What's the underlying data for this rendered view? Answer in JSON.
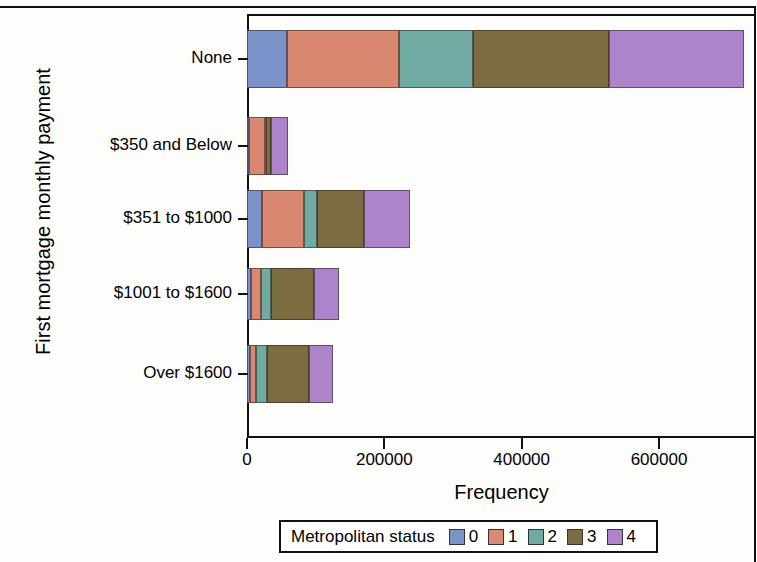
{
  "chart_data": {
    "type": "bar",
    "orientation": "horizontal",
    "stacked": true,
    "title": "",
    "xlabel": "Frequency",
    "ylabel": "First mortgage monthly payment",
    "xlim": [
      0,
      740000
    ],
    "xticks": [
      0,
      200000,
      400000,
      600000
    ],
    "xticklabels": [
      "0",
      "200000",
      "400000",
      "600000"
    ],
    "grid": false,
    "legend": {
      "title": "Metropolitan status",
      "position": "bottom",
      "entries": [
        {
          "label": "0",
          "color": "#7b93c8"
        },
        {
          "label": "1",
          "color": "#d98872"
        },
        {
          "label": "2",
          "color": "#6faaa3"
        },
        {
          "label": "3",
          "color": "#7b6c42"
        },
        {
          "label": "4",
          "color": "#ad84cb"
        }
      ]
    },
    "categories": [
      "None",
      "$350 and Below",
      "$351 to $1000",
      "$1001 to $1600",
      "Over $1600"
    ],
    "series": [
      {
        "name": "0",
        "color": "#7b93c8",
        "values": [
          58000,
          3000,
          22000,
          6000,
          4000
        ]
      },
      {
        "name": "1",
        "color": "#d98872",
        "values": [
          163000,
          23000,
          61000,
          15000,
          9000
        ]
      },
      {
        "name": "2",
        "color": "#6faaa3",
        "values": [
          108000,
          2000,
          19000,
          14000,
          16000
        ]
      },
      {
        "name": "3",
        "color": "#7b6c42",
        "values": [
          198000,
          7000,
          68000,
          62000,
          61000
        ]
      },
      {
        "name": "4",
        "color": "#ad84cb",
        "values": [
          197000,
          25000,
          67000,
          37000,
          35000
        ]
      }
    ],
    "totals": [
      724000,
      60000,
      237000,
      134000,
      125000
    ]
  },
  "axes": {
    "y_title": "First mortgage monthly payment",
    "x_title": "Frequency",
    "y_tick_labels": [
      "None",
      "$350 and Below",
      "$351 to $1000",
      "$1001 to $1600",
      "Over $1600"
    ],
    "x_tick_labels": [
      "0",
      "200000",
      "400000",
      "600000"
    ]
  },
  "legend": {
    "title": "Metropolitan status",
    "items": [
      {
        "label": "0",
        "color": "#7b93c8"
      },
      {
        "label": "1",
        "color": "#d98872"
      },
      {
        "label": "2",
        "color": "#6faaa3"
      },
      {
        "label": "3",
        "color": "#7b6c42"
      },
      {
        "label": "4",
        "color": "#ad84cb"
      }
    ]
  }
}
